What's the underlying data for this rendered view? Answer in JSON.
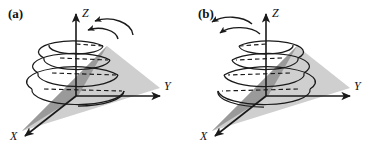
{
  "figure": {
    "background_color": "#ffffff",
    "panel_count": 2,
    "stroke_color": "#1a1a1a",
    "cone_dark_color": "#9a9a9a",
    "cone_light_color": "#cfcfcf"
  },
  "panels": [
    {
      "id": "a",
      "label": "(a)",
      "axes": {
        "x_label": "X",
        "y_label": "Y",
        "z_label": "Z"
      },
      "helix": {
        "turns": 4,
        "hidden_segments": "dashed",
        "widening": "downward",
        "rotation_sense": "counterclockwise-from-above"
      },
      "rotation_arrows": [
        {
          "name": "outer-rotation-arrow",
          "side": "right",
          "direction": "left"
        },
        {
          "name": "inner-rotation-arrow",
          "side": "right",
          "direction": "left"
        }
      ]
    },
    {
      "id": "b",
      "label": "(b)",
      "axes": {
        "x_label": "X",
        "y_label": "Y",
        "z_label": "Z"
      },
      "helix": {
        "turns": 4,
        "hidden_segments": "dashed",
        "widening": "downward",
        "rotation_sense": "clockwise-from-above"
      },
      "rotation_arrows": [
        {
          "name": "outer-rotation-arrow",
          "side": "left",
          "direction": "left"
        },
        {
          "name": "inner-rotation-arrow",
          "side": "left",
          "direction": "left"
        }
      ]
    }
  ]
}
